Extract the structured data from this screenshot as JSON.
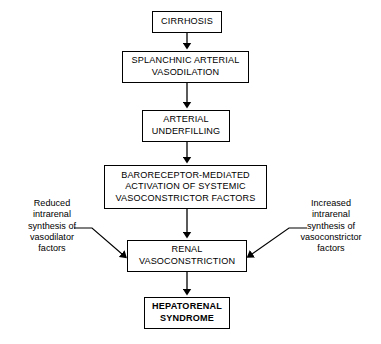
{
  "diagram": {
    "background_color": "#ffffff",
    "line_color": "#000000",
    "nodes": [
      {
        "id": "cirrhosis",
        "label": "CIRRHOSIS",
        "bold": false
      },
      {
        "id": "splanchnic",
        "label": "SPLANCHNIC ARTERIAL\nVASODILATION",
        "bold": false
      },
      {
        "id": "underfilling",
        "label": "ARTERIAL\nUNDERFILLING",
        "bold": false
      },
      {
        "id": "baroreceptor",
        "label": "BARORECEPTOR-MEDIATED\nACTIVATION OF SYSTEMIC\nVASOCONSTRICTOR FACTORS",
        "bold": false
      },
      {
        "id": "renal",
        "label": "RENAL\nVASOCONSTRICTION",
        "bold": false
      },
      {
        "id": "hepatorenal",
        "label": "HEPATORENAL\nSYNDROME",
        "bold": true
      }
    ],
    "annotations": [
      {
        "id": "left",
        "label": "Reduced\nintrarenal\nsynthesis of\nvasodilator\nfactors"
      },
      {
        "id": "right",
        "label": "Increased\nintrarenal\nsynthesis of\nvasoconstrictor\nfactors"
      }
    ],
    "edges": [
      {
        "from": "cirrhosis",
        "to": "splanchnic",
        "style": "vertical-arrow"
      },
      {
        "from": "splanchnic",
        "to": "underfilling",
        "style": "vertical-arrow"
      },
      {
        "from": "underfilling",
        "to": "baroreceptor",
        "style": "vertical-arrow"
      },
      {
        "from": "baroreceptor",
        "to": "renal",
        "style": "vertical-arrow"
      },
      {
        "from": "renal",
        "to": "hepatorenal",
        "style": "vertical-arrow"
      },
      {
        "from": "left",
        "to": "renal",
        "style": "diagonal-arrow"
      },
      {
        "from": "right",
        "to": "renal",
        "style": "diagonal-arrow"
      }
    ]
  }
}
